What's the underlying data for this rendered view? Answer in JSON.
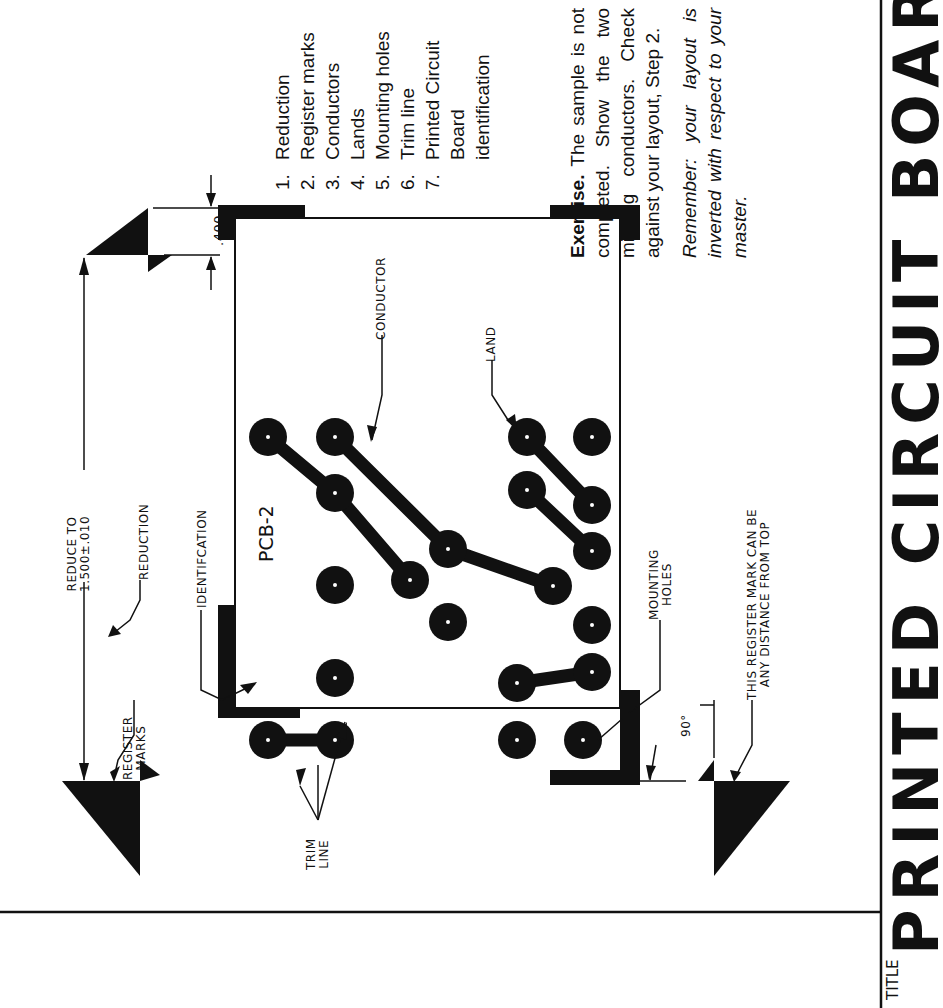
{
  "drawing": {
    "title_label": "TITLE",
    "title_text": "PRINTED CIRCUIT BOARD",
    "pcb_id": "PCB-2",
    "dimension_400": ".400",
    "callouts": {
      "reduce_to_line1": "REDUCE TO",
      "reduce_to_line2": "1.500±.010",
      "reduction": "REDUCTION",
      "identification": "IDENTIFCATION",
      "register_marks_line1": "REGISTER",
      "register_marks_line2": "MARKS",
      "trim_line_line1": "TRIM",
      "trim_line_line2": "LINE",
      "conductor": "CONDUCTOR",
      "land": "LAND",
      "mounting_holes_line1": "MOUNTING",
      "mounting_holes_line2": "HOLES",
      "angle": "90°",
      "register_note_line1": "THIS REGISTER MARK CAN BE",
      "register_note_line2": "ANY DISTANCE FROM TOP"
    },
    "legend": [
      {
        "num": "1.",
        "label": "Reduction"
      },
      {
        "num": "2.",
        "label": "Register marks"
      },
      {
        "num": "3.",
        "label": "Conductors"
      },
      {
        "num": "4.",
        "label": "Lands"
      },
      {
        "num": "5.",
        "label": "Mounting holes"
      },
      {
        "num": "6.",
        "label": "Trim line"
      },
      {
        "num": "7.",
        "label": "Printed Circuit"
      },
      {
        "num": "",
        "label": "Board"
      },
      {
        "num": "",
        "label": "identification"
      }
    ],
    "exercise": {
      "heading": "Exercise.",
      "text": "The sample is not completed. Show the two missing conductors. Check against your layout, Step 2."
    },
    "remember": "Remember: your layout is inverted with respect to your master.",
    "colors": {
      "ink": "#111111",
      "paper": "#ffffff"
    }
  }
}
